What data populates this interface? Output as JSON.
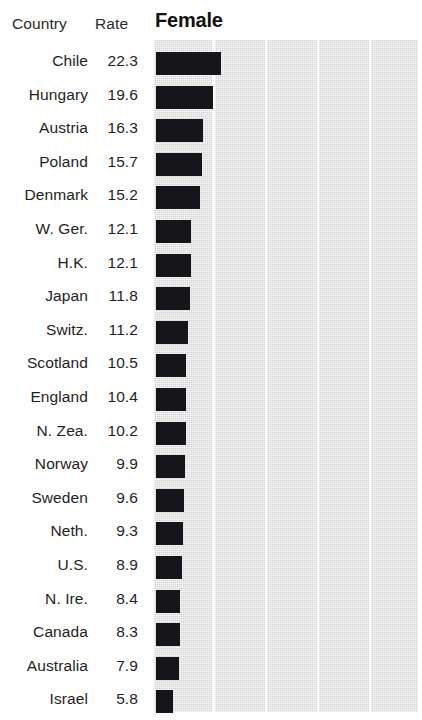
{
  "chart_data": {
    "type": "bar",
    "title": "Female",
    "orientation": "horizontal",
    "xlabel": "",
    "ylabel": "",
    "columns": [
      "Country",
      "Rate"
    ],
    "categories": [
      "Chile",
      "Hungary",
      "Austria",
      "Poland",
      "Denmark",
      "W. Ger.",
      "H.K.",
      "Japan",
      "Switz.",
      "Scotland",
      "England",
      "N. Zea.",
      "Norway",
      "Sweden",
      "Neth.",
      "U.S.",
      "N. Ire.",
      "Canada",
      "Australia",
      "Israel"
    ],
    "values": [
      22.3,
      19.6,
      16.3,
      15.7,
      15.2,
      12.1,
      12.1,
      11.8,
      11.2,
      10.5,
      10.4,
      10.2,
      9.9,
      9.6,
      9.3,
      8.9,
      8.4,
      8.3,
      7.9,
      5.8
    ],
    "value_labels": [
      "22.3",
      "19.6",
      "16.3",
      "15.7",
      "15.2",
      "12.1",
      "12.1",
      "11.8",
      "11.2",
      "10.5",
      "10.4",
      "10.2",
      "9.9",
      "9.6",
      "9.3",
      "8.9",
      "8.4",
      "8.3",
      "7.9",
      "5.8"
    ],
    "xlim": [
      0,
      93.8
    ],
    "grid": false,
    "legend": "none",
    "bar_color": "#15151a",
    "band_color": "#d4d4d4",
    "background_bands": 5
  },
  "table": {
    "header": {
      "country": "Country",
      "rate": "Rate"
    },
    "rows": [
      {
        "country": "Chile",
        "rate": "22.3"
      },
      {
        "country": "Hungary",
        "rate": "19.6"
      },
      {
        "country": "Austria",
        "rate": "16.3"
      },
      {
        "country": "Poland",
        "rate": "15.7"
      },
      {
        "country": "Denmark",
        "rate": "15.2"
      },
      {
        "country": "W. Ger.",
        "rate": "12.1"
      },
      {
        "country": "H.K.",
        "rate": "12.1"
      },
      {
        "country": "Japan",
        "rate": "11.8"
      },
      {
        "country": "Switz.",
        "rate": "11.2"
      },
      {
        "country": "Scotland",
        "rate": "10.5"
      },
      {
        "country": "England",
        "rate": "10.4"
      },
      {
        "country": "N. Zea.",
        "rate": "10.2"
      },
      {
        "country": "Norway",
        "rate": "9.9"
      },
      {
        "country": "Sweden",
        "rate": "9.6"
      },
      {
        "country": "Neth.",
        "rate": "9.3"
      },
      {
        "country": "U.S.",
        "rate": "8.9"
      },
      {
        "country": "N. Ire.",
        "rate": "8.4"
      },
      {
        "country": "Canada",
        "rate": "8.3"
      },
      {
        "country": "Australia",
        "rate": "7.9"
      },
      {
        "country": "Israel",
        "rate": "5.8"
      }
    ]
  }
}
